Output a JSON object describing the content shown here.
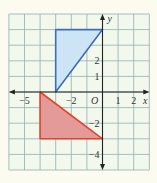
{
  "colors": {
    "background": "#fbfbf0",
    "grid_bg": "#f3f8ec",
    "grid_line": "#8fb0b4",
    "axis": "#222222",
    "blue_fill": "#cde4f6",
    "blue_stroke": "#3d6fb6",
    "red_fill": "#e59a9a",
    "red_stroke": "#e0452c"
  },
  "grid": {
    "x_min": -6,
    "x_max": 3,
    "y_min": -5,
    "y_max": 5
  },
  "axes": {
    "x_label": "x",
    "y_label": "y",
    "origin_label": "O",
    "x_ticks": [
      {
        "value": -5,
        "label": "−5"
      },
      {
        "value": -2,
        "label": "−2"
      },
      {
        "value": 1,
        "label": "1"
      },
      {
        "value": 2,
        "label": "2"
      }
    ],
    "y_ticks": [
      {
        "value": 2,
        "label": "2"
      },
      {
        "value": 1,
        "label": "1"
      },
      {
        "value": -2,
        "label": "−2"
      },
      {
        "value": -4,
        "label": "−4"
      }
    ]
  },
  "shapes": [
    {
      "name": "blue-triangle",
      "vertices": [
        [
          -3,
          4
        ],
        [
          0,
          4
        ],
        [
          -3,
          0
        ]
      ],
      "color": "blue"
    },
    {
      "name": "red-triangle",
      "vertices": [
        [
          -4,
          0
        ],
        [
          -4,
          -3
        ],
        [
          0,
          -3
        ]
      ],
      "color": "red"
    }
  ]
}
